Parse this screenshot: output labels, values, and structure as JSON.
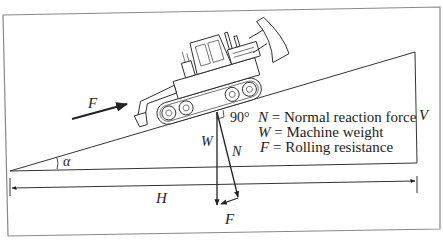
{
  "figure": {
    "type": "free-body diagram",
    "frame_color": "#888888",
    "line_color": "#333333"
  },
  "labels": {
    "applied_force": "F",
    "angle": "α",
    "horizontal": "H",
    "vertical": "V",
    "right_angle": "90°",
    "weight_vector": "W",
    "normal_vector": "N",
    "resultant_force": "F"
  },
  "legend": [
    {
      "symbol": "N",
      "eq": " = ",
      "text": "Normal reaction force"
    },
    {
      "symbol": "W",
      "eq": " = ",
      "text": "Machine weight"
    },
    {
      "symbol": "F",
      "eq": " = ",
      "text": "Rolling resistance"
    }
  ]
}
